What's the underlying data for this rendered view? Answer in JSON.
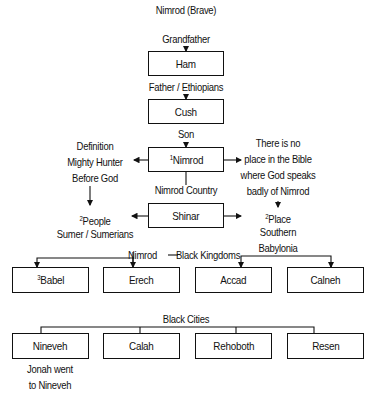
{
  "title": "Nimrod (Brave)",
  "lineage": {
    "grandfather_label": "Grandfather",
    "grandfather": "Ham",
    "father_label": "Father / Ethiopians",
    "father": "Cush",
    "son_label": "Son",
    "son_sup": "1",
    "son": "Nimrod",
    "country_label": "Nimrod Country",
    "country": "Shinar"
  },
  "left_notes": {
    "definition": [
      "Definition",
      "Mighty Hunter",
      "Before God"
    ],
    "people_sup": "2",
    "people": [
      "People",
      "Sumer / Sumerians"
    ]
  },
  "right_notes": {
    "statement": [
      "There is no",
      "place in the Bible",
      "where God speaks",
      "badly of Nimrod"
    ],
    "place_sup": "2",
    "place": [
      "Place",
      "Southern",
      "Babylonia"
    ]
  },
  "kingdoms": {
    "label_left": "Nimrod",
    "label_dash": "—",
    "label_right": "Black Kingdoms",
    "items": [
      {
        "sup": "3",
        "name": "Babel"
      },
      {
        "sup": "",
        "name": "Erech"
      },
      {
        "sup": "",
        "name": "Accad"
      },
      {
        "sup": "",
        "name": "Calneh"
      }
    ]
  },
  "cities": {
    "label": "Black Cities",
    "items": [
      {
        "name": "Nineveh"
      },
      {
        "name": "Calah"
      },
      {
        "name": "Rehoboth"
      },
      {
        "name": "Resen"
      }
    ],
    "note": [
      "Jonah went",
      "to Nineveh"
    ]
  },
  "colors": {
    "line": "#111111",
    "background": "#ffffff"
  }
}
